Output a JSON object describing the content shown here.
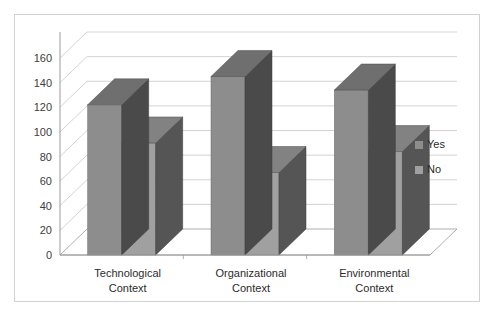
{
  "page": {
    "top_sliver_text": ""
  },
  "chart_data": {
    "type": "bar",
    "title": "",
    "subtitle": "",
    "xlabel": "",
    "ylabel": "",
    "categories": [
      "Technological Context",
      "Organizational Context",
      "Environmental Context"
    ],
    "category_lines": [
      [
        "Technological",
        "Context"
      ],
      [
        "Organizational",
        "Context"
      ],
      [
        "Environmental",
        "Context"
      ]
    ],
    "series": [
      {
        "name": "Yes",
        "values": [
          122,
          145,
          134
        ],
        "color": "#8d8d8d",
        "side_color": "#4a4a4a",
        "top_color": "#6f6f6f"
      },
      {
        "name": "No",
        "values": [
          91,
          67,
          84
        ],
        "color": "#a0a0a0",
        "side_color": "#555555",
        "top_color": "#828282"
      }
    ],
    "ylim": [
      0,
      160
    ],
    "yticks": [
      0,
      20,
      40,
      60,
      80,
      100,
      120,
      140,
      160
    ],
    "ytick_labels": [
      "0",
      "20",
      "40",
      "60",
      "80",
      "100",
      "120",
      "140",
      "160"
    ],
    "grid": true,
    "grid_color": "#c8c8c8",
    "axis_color": "#9a9a9a",
    "legend": {
      "position": "right",
      "entries": [
        {
          "label": "Yes",
          "color": "#8d8d8d"
        },
        {
          "label": "No",
          "color": "#a0a0a0"
        }
      ]
    },
    "style": "3d-column",
    "plot_background": "#ffffff",
    "frame_border_color": "#d2d2d2"
  }
}
